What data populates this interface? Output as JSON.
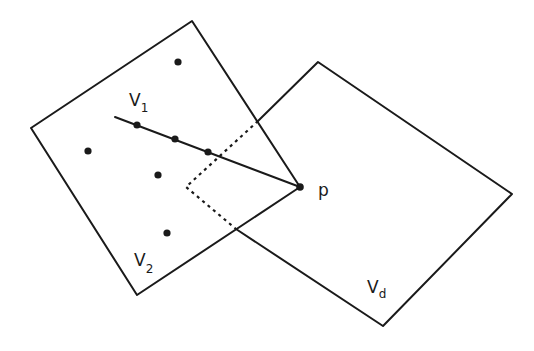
{
  "diagram": {
    "labels": {
      "v1": {
        "main": "V",
        "sub": "1"
      },
      "v2": {
        "main": "V",
        "sub": "2"
      },
      "vd": {
        "main": "V",
        "sub": "d"
      },
      "p": "p"
    },
    "colors": {
      "stroke": "#1a1a1a",
      "background": "#ffffff"
    }
  }
}
